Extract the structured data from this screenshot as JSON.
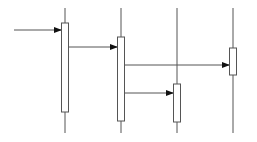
{
  "diagram": {
    "type": "sequence",
    "stroke_color": "#555555",
    "fill_color": "#ffffff",
    "lifelines": [
      {
        "id": "L1",
        "x": 65,
        "y1": 8,
        "y2": 133,
        "activation": {
          "y": 23,
          "h": 89
        }
      },
      {
        "id": "L2",
        "x": 121,
        "y1": 8,
        "y2": 133,
        "activation": {
          "y": 37,
          "h": 84
        }
      },
      {
        "id": "L3",
        "x": 177,
        "y1": 8,
        "y2": 133,
        "activation": {
          "y": 84,
          "h": 38
        }
      },
      {
        "id": "L4",
        "x": 233,
        "y1": 8,
        "y2": 133,
        "activation": {
          "y": 48,
          "h": 27
        }
      }
    ],
    "messages": [
      {
        "from_x": 14,
        "to_x": 62,
        "y": 30
      },
      {
        "from_x": 69,
        "to_x": 118,
        "y": 47
      },
      {
        "from_x": 125,
        "to_x": 230,
        "y": 65
      },
      {
        "from_x": 125,
        "to_x": 174,
        "y": 93
      }
    ]
  }
}
